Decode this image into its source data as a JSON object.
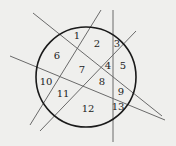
{
  "diagram": {
    "circle": {
      "cx": 86,
      "cy": 77,
      "r": 50,
      "stroke": "#1a1a1a",
      "stroke_width": 1.6
    },
    "line_color": "#6a6a6a",
    "lines": [
      {
        "x1": 101,
        "y1": 10,
        "x2": 30,
        "y2": 125
      },
      {
        "x1": 33,
        "y1": 13,
        "x2": 162,
        "y2": 116
      },
      {
        "x1": 113,
        "y1": 10,
        "x2": 113,
        "y2": 142
      },
      {
        "x1": 136,
        "y1": 31,
        "x2": 40,
        "y2": 131
      },
      {
        "x1": 10,
        "y1": 56,
        "x2": 165,
        "y2": 120
      }
    ],
    "regions": [
      {
        "label": "1",
        "x": 77,
        "y": 36
      },
      {
        "label": "2",
        "x": 97,
        "y": 44
      },
      {
        "label": "3",
        "x": 117,
        "y": 44
      },
      {
        "label": "4",
        "x": 108,
        "y": 66
      },
      {
        "label": "5",
        "x": 123,
        "y": 66
      },
      {
        "label": "6",
        "x": 57,
        "y": 56
      },
      {
        "label": "7",
        "x": 82,
        "y": 70
      },
      {
        "label": "8",
        "x": 102,
        "y": 82
      },
      {
        "label": "9",
        "x": 121,
        "y": 92
      },
      {
        "label": "10",
        "x": 46,
        "y": 82
      },
      {
        "label": "11",
        "x": 63,
        "y": 94
      },
      {
        "label": "12",
        "x": 88,
        "y": 109
      },
      {
        "label": "13",
        "x": 118,
        "y": 107
      }
    ]
  }
}
